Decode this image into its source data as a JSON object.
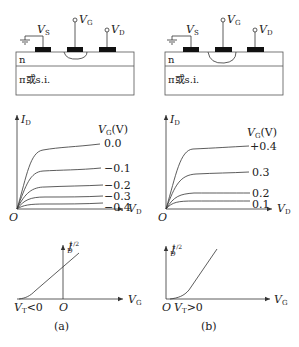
{
  "panels": [
    {
      "id": "a",
      "caption": "(a)",
      "device": {
        "terminals": {
          "source": "V",
          "source_sub": "S",
          "gate": "V",
          "gate_sub": "G",
          "drain": "V",
          "drain_sub": "D"
        },
        "layer_top": "n",
        "layer_bottom": "π或s.i."
      },
      "output_curves": {
        "y_label": "I",
        "y_sub": "D",
        "x_label": "V",
        "x_sub": "D",
        "origin": "O",
        "legend_title": "V",
        "legend_sub": "G",
        "legend_unit": "(V)",
        "curves": [
          "0.0",
          "−0.1",
          "−0.2",
          "−0.3",
          "−0.4"
        ]
      },
      "transfer": {
        "y_label": "I",
        "y_sub": "D",
        "y_sup": "1/2",
        "x_label": "V",
        "x_sub": "G",
        "origin": "O",
        "threshold_label": "V",
        "threshold_sub": "T",
        "threshold_rel": "<0"
      }
    },
    {
      "id": "b",
      "caption": "(b)",
      "device": {
        "terminals": {
          "source": "V",
          "source_sub": "S",
          "gate": "V",
          "gate_sub": "G",
          "drain": "V",
          "drain_sub": "D"
        },
        "layer_top": "n",
        "layer_bottom": "π或s.i."
      },
      "output_curves": {
        "y_label": "I",
        "y_sub": "D",
        "x_label": "V",
        "x_sub": "D",
        "origin": "O",
        "legend_title": "V",
        "legend_sub": "G",
        "legend_unit": "(V)",
        "curves": [
          "+0.4",
          "0.3",
          "0.2",
          "0.1"
        ]
      },
      "transfer": {
        "y_label": "I",
        "y_sub": "D",
        "y_sup": "1/2",
        "x_label": "V",
        "x_sub": "G",
        "origin": "O",
        "threshold_label": "V",
        "threshold_sub": "T",
        "threshold_rel": ">0"
      }
    }
  ],
  "colors": {
    "line": "#333333",
    "contact": "#111111",
    "background": "#ffffff"
  }
}
